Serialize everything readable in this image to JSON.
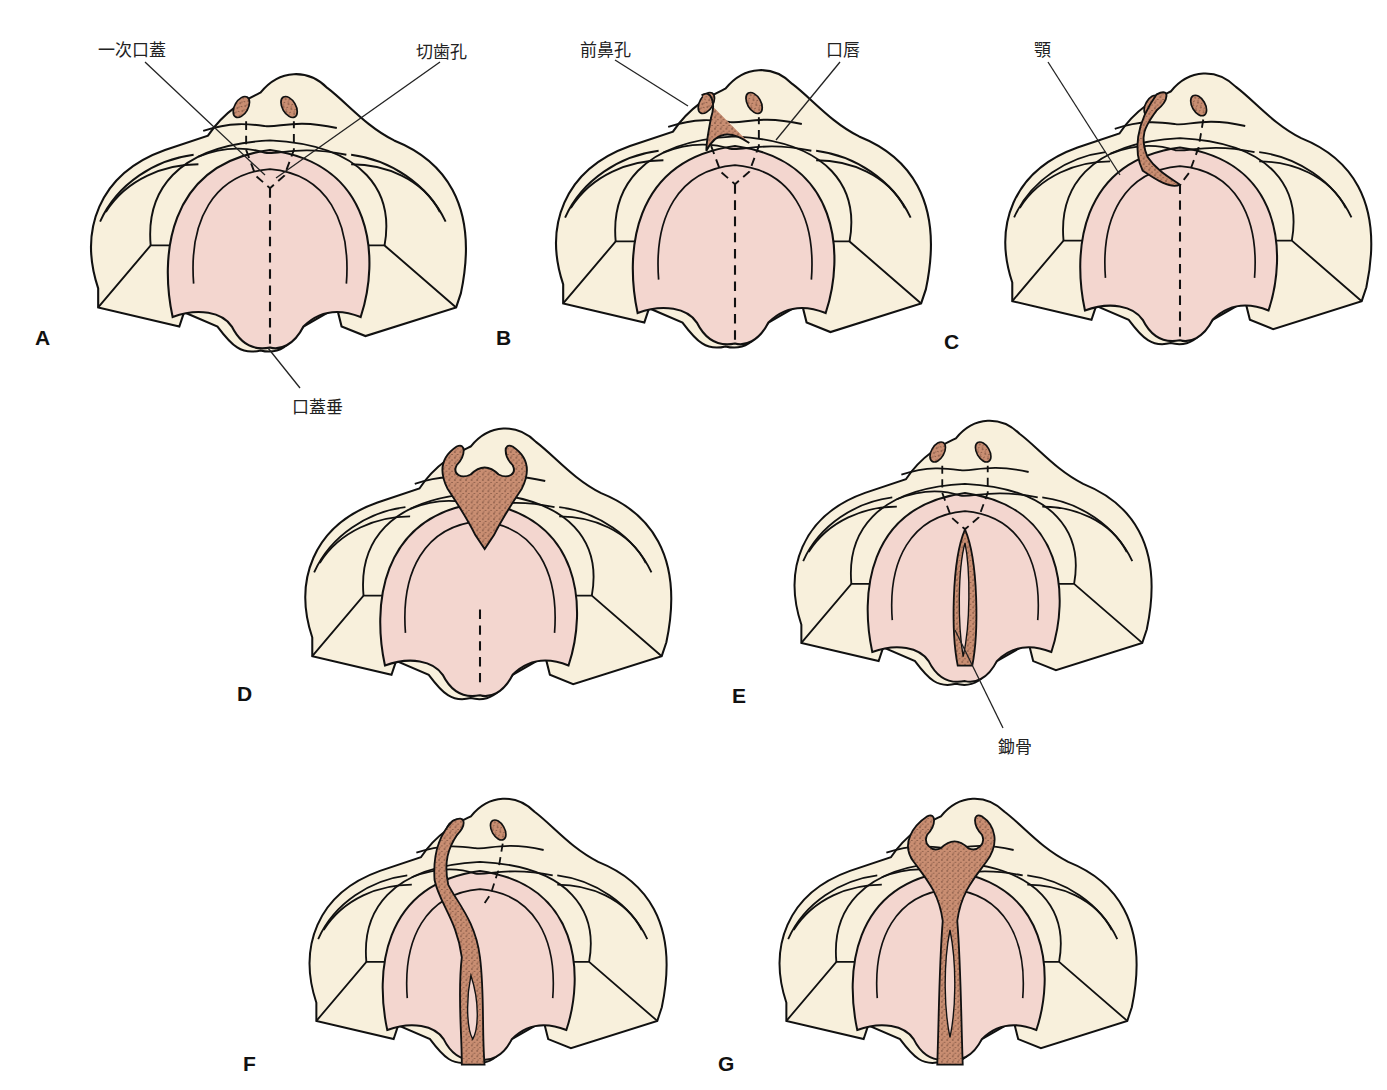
{
  "figure": {
    "colors": {
      "skin": "#f8f0dc",
      "palate": "#f3d6cf",
      "bone_stipple": "#c98e72",
      "bone_dots": "#5a3325",
      "outline": "#111111",
      "uvula_tip_shaded": "#e8a488"
    },
    "panels": [
      {
        "id": "A",
        "letter": "A",
        "variant": "normal"
      },
      {
        "id": "B",
        "letter": "B",
        "variant": "unilateral-cleft-lip"
      },
      {
        "id": "C",
        "letter": "C",
        "variant": "unilateral-cleft-lip-jaw"
      },
      {
        "id": "D",
        "letter": "D",
        "variant": "bilateral-cleft-lip-jaw"
      },
      {
        "id": "E",
        "letter": "E",
        "variant": "cleft-palate"
      },
      {
        "id": "F",
        "letter": "F",
        "variant": "unilateral-cleft-lip-palate"
      },
      {
        "id": "G",
        "letter": "G",
        "variant": "bilateral-cleft-lip-palate"
      }
    ],
    "labels": {
      "primary_palate": "一次口蓋",
      "incisive_foramen": "切歯孔",
      "uvula": "口蓋垂",
      "nostril": "前鼻孔",
      "lip": "口唇",
      "jaw": "顎",
      "vomer": "鋤骨"
    }
  }
}
